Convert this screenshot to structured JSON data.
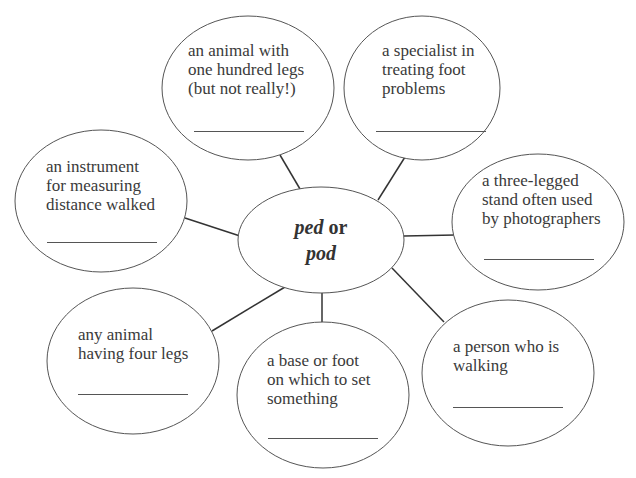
{
  "diagram": {
    "type": "word-web",
    "center": {
      "root1": "ped",
      "connector": "or",
      "root2": "pod"
    },
    "bubbles": [
      {
        "id": "centipede",
        "clue": [
          "an animal with",
          "one hundred legs",
          "(but not really!)"
        ],
        "answer": ""
      },
      {
        "id": "podiatrist",
        "clue": [
          "a specialist in",
          "treating foot",
          "problems"
        ],
        "answer": ""
      },
      {
        "id": "pedometer",
        "clue": [
          "an instrument",
          "for measuring",
          "distance walked"
        ],
        "answer": ""
      },
      {
        "id": "tripod",
        "clue": [
          "a three-legged",
          "stand often used",
          "by photographers"
        ],
        "answer": ""
      },
      {
        "id": "quadruped",
        "clue": [
          "any animal",
          "having four legs"
        ],
        "answer": ""
      },
      {
        "id": "pedestal",
        "clue": [
          "a base or foot",
          "on which to set",
          "something"
        ],
        "answer": ""
      },
      {
        "id": "pedestrian",
        "clue": [
          "a person who is",
          "walking"
        ],
        "answer": ""
      }
    ],
    "colors": {
      "stroke": "#555555",
      "line": "#333333",
      "text": "#3a3a3a",
      "background": "#ffffff"
    }
  }
}
